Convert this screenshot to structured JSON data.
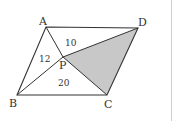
{
  "figure": {
    "type": "parallelogram-with-interior-point",
    "points": {
      "A": {
        "label": "A",
        "x": 46,
        "y": 27
      },
      "B": {
        "label": "B",
        "x": 17,
        "y": 95
      },
      "C": {
        "label": "C",
        "x": 107,
        "y": 95
      },
      "D": {
        "label": "D",
        "x": 138,
        "y": 28
      },
      "P": {
        "label": "P",
        "x": 63,
        "y": 57
      }
    },
    "areas": {
      "APD": "10",
      "APB": "12",
      "BPC": "20"
    },
    "shaded_region": "triangle PCD",
    "colors": {
      "stroke": "#333333",
      "shade": "#c8c8c8",
      "divider": "#cfcfcf"
    }
  }
}
